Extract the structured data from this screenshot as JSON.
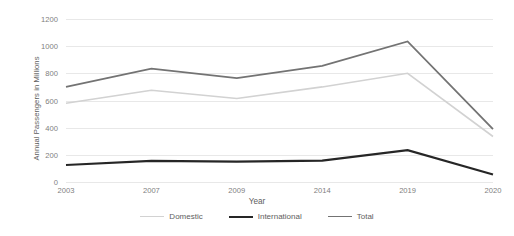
{
  "chart_data": {
    "type": "line",
    "title": "",
    "xlabel": "Year",
    "ylabel": "Annual Passengers in Millions",
    "categories": [
      "2003",
      "2007",
      "2009",
      "2014",
      "2019",
      "2020"
    ],
    "ylim": [
      0,
      1200
    ],
    "yticks": [
      0,
      200,
      400,
      600,
      800,
      1000,
      1200
    ],
    "grid": true,
    "legend_position": "bottom",
    "series": [
      {
        "name": "Domestic",
        "color": "#d2d2d2",
        "values": [
          580,
          675,
          615,
          700,
          800,
          335
        ]
      },
      {
        "name": "International",
        "color": "#262626",
        "values": [
          125,
          155,
          150,
          158,
          235,
          55
        ]
      },
      {
        "name": "Total",
        "color": "#737373",
        "values": [
          700,
          835,
          765,
          855,
          1035,
          390
        ]
      }
    ]
  }
}
